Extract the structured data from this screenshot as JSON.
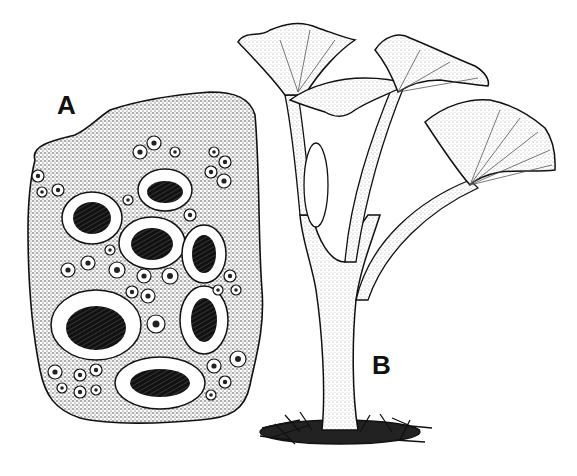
{
  "figure": {
    "panels": [
      {
        "id": "A",
        "label": "A",
        "subject": "stippled substrate fragment covered with ring-rimmed cup-shaped fruiting bodies (apothecia)"
      },
      {
        "id": "B",
        "label": "B",
        "subject": "branched trumpet-shaped fruiting body with flared, fan-like cups on a single stalk rising from a mossy base"
      }
    ],
    "style": "black-and-white stipple pen illustration",
    "colors": {
      "ink": "#111111",
      "paper": "#ffffff",
      "stipple": "#555555"
    }
  }
}
